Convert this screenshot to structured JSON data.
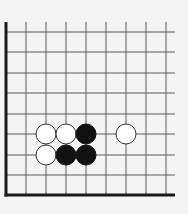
{
  "board": {
    "background": "#f4f4f4",
    "line_color": "#5a5a5a",
    "edge_color": "#1a1a1a",
    "columns_x": [
      6,
      26,
      46,
      66,
      86,
      106,
      126,
      146,
      166
    ],
    "rows_y": [
      32,
      52,
      73,
      93,
      114,
      134,
      155,
      175,
      195
    ],
    "edges": [
      "left",
      "bottom"
    ],
    "line_extent": {
      "top": 22,
      "right": 175
    },
    "stone_radius": 10
  },
  "stones": [
    {
      "color": "white",
      "col": 2,
      "row": 5
    },
    {
      "color": "white",
      "col": 3,
      "row": 5
    },
    {
      "color": "black",
      "col": 4,
      "row": 5
    },
    {
      "color": "white",
      "col": 6,
      "row": 5
    },
    {
      "color": "white",
      "col": 2,
      "row": 6
    },
    {
      "color": "black",
      "col": 3,
      "row": 6
    },
    {
      "color": "black",
      "col": 4,
      "row": 6
    }
  ]
}
